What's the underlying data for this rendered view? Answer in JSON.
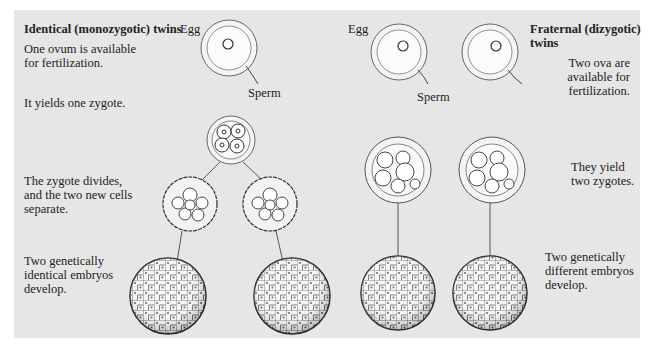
{
  "left": {
    "title": "Identical (monozygotic) twins",
    "step1": "One ovum is available\nfor fertilization.",
    "step2": "It yields one zygote.",
    "step3": "The zygote divides,\nand the two new cells\nseparate.",
    "step4": "Two genetically\nidentical embryos\ndevelop.",
    "egg_label": "Egg",
    "sperm_label": "Sperm"
  },
  "right": {
    "title": "Fraternal (dizygotic)\ntwins",
    "step1": "Two ova are\navailable for\nfertilization.",
    "step2": "They yield\ntwo zygotes.",
    "step4": "Two genetically\ndifferent embryos\ndevelop.",
    "egg_label": "Egg",
    "sperm_label": "Sperm"
  },
  "colors": {
    "panel_bg": "#e6e6e6",
    "ink": "#222222",
    "cell_fill": "#f7f7f5"
  }
}
